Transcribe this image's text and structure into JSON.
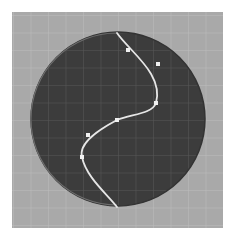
{
  "canvas": {
    "background": "#a9a9a9",
    "grid_color": "#bdbdbd",
    "grid_spacing": 17.5,
    "disc": {
      "cx": 106,
      "cy": 107,
      "r": 87,
      "fill": "#3c3c3c",
      "rim_color": "#6a6a6a",
      "grid_color": "#555555"
    },
    "curve": {
      "color": "#e6e6e6",
      "path_points": [
        [
          105,
          21
        ],
        [
          144,
          91
        ],
        [
          105,
          108
        ],
        [
          70,
          145
        ],
        [
          105,
          195
        ]
      ]
    },
    "anchor_points": [
      {
        "x": 105,
        "y": 108,
        "role": "on-curve"
      },
      {
        "x": 144,
        "y": 91,
        "role": "on-curve"
      },
      {
        "x": 70,
        "y": 145,
        "role": "on-curve"
      }
    ],
    "control_points": [
      {
        "x": 116,
        "y": 38
      },
      {
        "x": 146,
        "y": 52
      },
      {
        "x": 76,
        "y": 123
      }
    ],
    "point_color": "#f0f0f0"
  }
}
